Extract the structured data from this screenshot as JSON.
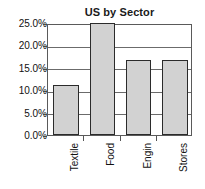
{
  "chart_data": {
    "type": "bar",
    "title": "US by Sector",
    "xlabel": "",
    "ylabel": "",
    "categories": [
      "Textile",
      "Food",
      "Engin",
      "Stores"
    ],
    "values": [
      11.2,
      25.0,
      16.7,
      16.7
    ],
    "ylim": [
      0.0,
      25.0
    ],
    "ytick_values": [
      0.0,
      5.0,
      10.0,
      15.0,
      20.0,
      25.0
    ],
    "ytick_labels": [
      "0.0%",
      "5.0%",
      "10.0%",
      "15.0%",
      "20.0%",
      "25.0%"
    ],
    "grid": true,
    "legend": false,
    "legend_position": "none",
    "value_suffix": "%",
    "bar_fill_color": "#d2d2d2",
    "bar_border_color": "#2b2b2b",
    "grid_color": "#6b6b6b",
    "frame_color": "#5a5a5a",
    "text_color": "#111111",
    "background_color": "#ffffff"
  }
}
